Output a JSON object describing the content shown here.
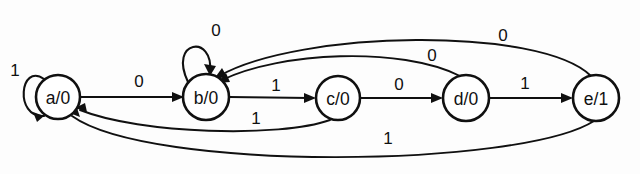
{
  "diagram": {
    "type": "mealy-state-machine",
    "title": "",
    "states": [
      {
        "id": "a",
        "label": "a/0",
        "cx": 58,
        "cy": 97,
        "r": 22,
        "output": "0"
      },
      {
        "id": "b",
        "label": "b/0",
        "cx": 206,
        "cy": 97,
        "r": 23,
        "output": "0"
      },
      {
        "id": "c",
        "label": "c/0",
        "cx": 338,
        "cy": 98,
        "r": 22,
        "output": "0"
      },
      {
        "id": "d",
        "label": "d/0",
        "cx": 466,
        "cy": 98,
        "r": 23,
        "output": "0"
      },
      {
        "id": "e",
        "label": "e/1",
        "cx": 596,
        "cy": 98,
        "r": 23,
        "output": "1"
      }
    ],
    "transitions": [
      {
        "id": "a-a",
        "from": "a",
        "to": "a",
        "label": "1",
        "kind": "self-loop",
        "lx": 15,
        "ly": 70
      },
      {
        "id": "a-b",
        "from": "a",
        "to": "b",
        "label": "0",
        "kind": "straight",
        "lx": 139,
        "ly": 81
      },
      {
        "id": "b-b",
        "from": "b",
        "to": "b",
        "label": "0",
        "kind": "self-loop",
        "lx": 216,
        "ly": 30
      },
      {
        "id": "b-c",
        "from": "b",
        "to": "c",
        "label": "1",
        "kind": "straight",
        "lx": 276,
        "ly": 85
      },
      {
        "id": "c-d",
        "from": "c",
        "to": "d",
        "label": "0",
        "kind": "straight",
        "lx": 399,
        "ly": 84
      },
      {
        "id": "c-a",
        "from": "c",
        "to": "a",
        "label": "1",
        "kind": "arc-below",
        "lx": 256,
        "ly": 118
      },
      {
        "id": "d-e",
        "from": "d",
        "to": "e",
        "label": "1",
        "kind": "straight",
        "lx": 525,
        "ly": 83
      },
      {
        "id": "d-b",
        "from": "d",
        "to": "b",
        "label": "0",
        "kind": "arc-above",
        "lx": 432,
        "ly": 55
      },
      {
        "id": "e-b",
        "from": "e",
        "to": "b",
        "label": "0",
        "kind": "arc-above",
        "lx": 503,
        "ly": 35
      },
      {
        "id": "e-a",
        "from": "e",
        "to": "a",
        "label": "1",
        "kind": "arc-below",
        "lx": 388,
        "ly": 138
      }
    ],
    "colors": {
      "stroke": "#101010",
      "node_fill": "#ffffff",
      "background": "#fdfdfd"
    }
  }
}
